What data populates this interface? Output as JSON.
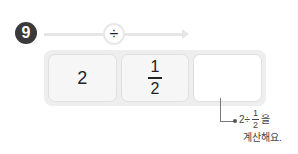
{
  "problem": {
    "number": "9",
    "operator": "÷",
    "cells": [
      {
        "type": "whole",
        "value": "2"
      },
      {
        "type": "fraction",
        "numerator": "1",
        "denominator": "2"
      },
      {
        "type": "blank",
        "value": ""
      }
    ],
    "hint": {
      "expr_prefix": "2÷",
      "frac_numerator": "1",
      "frac_denominator": "2",
      "particle": "을",
      "line2": "계산해요."
    }
  },
  "colors": {
    "badge": "#3a3a3a",
    "arrow": "#e6e6e6",
    "row_bg": "#eeeeee",
    "cell_bg": "#f6f6f6"
  }
}
